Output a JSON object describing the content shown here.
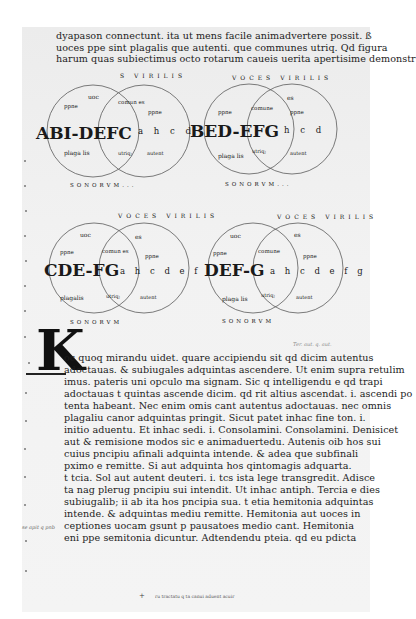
{
  "document": {
    "type": "scanned medieval manuscript page",
    "script": "Caroline minuscule (Latin)",
    "colors": {
      "background": "#ffffff",
      "page": "#f1f1f1",
      "ink": "#1a1a1a",
      "circle_stroke": "#5a5a5a"
    }
  },
  "header_text": {
    "lines": [
      "dyapason connectunt. ita ut mens facile animadvertere possit. ß",
      "uoces ppe sint plagalis que autenti. que communes utriq. Qd figura",
      "harum quas subiectimus octo rotarum caueis uerita apertisime demonstr"
    ]
  },
  "diagrams": [
    {
      "id": "diagram-1",
      "big_label_left": "ABI-DEFC",
      "big_label_right": "a h c d",
      "left_circle": {
        "top": "uoc",
        "mid": "ppne",
        "bottom": "plaga lis"
      },
      "overlap": {
        "top": "comun es",
        "bottom": "utriq;"
      },
      "right_circle": {
        "top": "s",
        "mid": "ppne",
        "bottom": "autent"
      },
      "rim_left": "PRIMI VIRGILIS... choris",
      "rim_top": "S VIRILIS",
      "rim_bottom": "SONORVM..."
    },
    {
      "id": "diagram-2",
      "big_label_left": "BED-EFG",
      "big_label_right": "h c d",
      "left_circle": {
        "top": "uoc",
        "mid": "ppne",
        "bottom": "plaga lis"
      },
      "overlap": {
        "top": "comune",
        "bottom": "utriq;"
      },
      "right_circle": {
        "top": "es",
        "mid": "ppne",
        "bottom": "autent"
      },
      "rim_top": "VOCES VIRILIS",
      "rim_bottom": "SONORVM..."
    },
    {
      "id": "diagram-3",
      "big_label_left": "CDE-FG",
      "big_label_right": "a h c d e f",
      "left_circle": {
        "top": "uoc",
        "mid": "ppne",
        "bottom": "plagalis"
      },
      "overlap": {
        "top": "comun es",
        "bottom": "utriq;"
      },
      "right_circle": {
        "top": "es",
        "mid": "ppne",
        "bottom": "autent"
      },
      "rim_left": "tertii choris",
      "rim_top": "VOCES VIRILIS",
      "rim_bottom": "SONORVM"
    },
    {
      "id": "diagram-4",
      "big_label_left": "DEF-G",
      "big_label_right": "a h c d e f g",
      "left_circle": {
        "top": "uoc",
        "mid": "ppne",
        "bottom": "plaga lis"
      },
      "overlap": {
        "top": "comune",
        "bottom": "utriq;"
      },
      "right_circle": {
        "top": "es",
        "mid": "ppne",
        "bottom": "autent"
      },
      "rim_left": "quarti choris",
      "rim_top": "VOCES VIRILIS",
      "rim_bottom": "SONORVM"
    }
  ],
  "initial": {
    "letter": "K"
  },
  "annotation_top_right": "Ter. aut. q. aut.",
  "body_text": {
    "lines": [
      "oc quoq mirandu uidet. quare accipiendu sit qd dicim autentus",
      "adoctauas. & subiugales adquintas ascendere. Ut enim supra retulim",
      "imus. pateris uni opculo ma signam. Sic q intelligendu e qd trapi",
      "adoctauas t quintas ascende dicim. qd rit altius ascendat. i. ascendi po",
      "tenta habeant. Nec enim omis cant autentus adoctauas. nec omnis",
      "plagaliu canor adquintas pringit. Sicut patet inhac fine ton. i.",
      "initio aduentu. Et inhac sedi. i. Consolamini. Consolamini. Denisicet",
      "aut & remisione modos sic e animaduertedu. Autenis oib hos sui",
      "cuius pncipiu afinali adquinta intende. & adea que subfinali",
      "pximo e remitte. Si aut adquinta hos qintomagis adquarta.",
      "t tcia. Sol aut autent deuteri. i. tcs ista lege transgredit. Adisce",
      "ta nag plerug pncipiu sui intendit. Ut inhac antiph. Tercia e dies",
      "subiugalib; ii ab ita hos pncipia sua. t etia hemitonia adquintas",
      "intende. & adquintas mediu remitte. Hemitonia aut uoces in",
      "ceptiones uocam gsunt p pausatoes medio cant. Hemitonia",
      "eni ppe semitonia dicuntur. Adtendendu pteia. qd eu pdicta"
    ]
  },
  "margin_note_left": "se apit q pnb",
  "interlinear_gloss": "demonstr",
  "colophon": {
    "cross": "+",
    "text": "ru tractatu q ta canui aduent acuir"
  }
}
